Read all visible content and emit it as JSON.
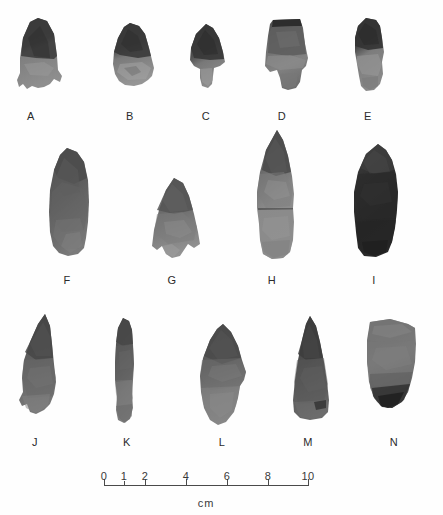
{
  "figure": {
    "type": "archaeological-artifact-plate",
    "background_color": "#fefefe",
    "ink_color": "#3a3a3a",
    "rows": 3,
    "artifact_count": 14
  },
  "artifacts": [
    {
      "label": "A",
      "row": 1,
      "form": "side-notched-point-eared-base",
      "tone": "dark-gray-over-medium-gray",
      "x": 14,
      "y": 18,
      "w": 52,
      "h": 78,
      "label_x": 21,
      "label_y": 110
    },
    {
      "label": "B",
      "row": 1,
      "form": "broad-stemmed-point",
      "tone": "dark-gray-over-light-gray",
      "x": 108,
      "y": 22,
      "w": 50,
      "h": 72,
      "label_x": 120,
      "label_y": 110
    },
    {
      "label": "C",
      "row": 1,
      "form": "deeply-side-notched-point",
      "tone": "dark-gray",
      "x": 186,
      "y": 24,
      "w": 44,
      "h": 70,
      "label_x": 196,
      "label_y": 110
    },
    {
      "label": "D",
      "row": 1,
      "form": "square-base-notched-point",
      "tone": "medium-gray",
      "x": 260,
      "y": 18,
      "w": 52,
      "h": 76,
      "label_x": 272,
      "label_y": 110
    },
    {
      "label": "E",
      "row": 1,
      "form": "narrow-stemmed-point",
      "tone": "dark-gray-mottled",
      "x": 348,
      "y": 18,
      "w": 44,
      "h": 78,
      "label_x": 358,
      "label_y": 110
    },
    {
      "label": "F",
      "row": 2,
      "form": "large-ovate-biface",
      "tone": "dark-gray",
      "x": 44,
      "y": 148,
      "w": 50,
      "h": 112,
      "label_x": 57,
      "label_y": 274
    },
    {
      "label": "G",
      "row": 2,
      "form": "stemmed-triangular-point",
      "tone": "medium-gray",
      "x": 148,
      "y": 178,
      "w": 54,
      "h": 86,
      "label_x": 162,
      "label_y": 274
    },
    {
      "label": "H",
      "row": 2,
      "form": "long-stemmed-lanceolate-point",
      "tone": "medium-gray-light-base",
      "x": 250,
      "y": 130,
      "w": 50,
      "h": 132,
      "label_x": 262,
      "label_y": 274
    },
    {
      "label": "I",
      "row": 2,
      "form": "thick-dark-biface-core",
      "tone": "near-black",
      "x": 344,
      "y": 144,
      "w": 58,
      "h": 118,
      "label_x": 364,
      "label_y": 274
    },
    {
      "label": "J",
      "row": 3,
      "form": "elongated-triangular-point",
      "tone": "dark-gray",
      "x": 14,
      "y": 314,
      "w": 48,
      "h": 110,
      "label_x": 25,
      "label_y": 436
    },
    {
      "label": "K",
      "row": 3,
      "form": "narrow-elongate-drill-point",
      "tone": "medium-dark-gray",
      "x": 110,
      "y": 318,
      "w": 28,
      "h": 108,
      "label_x": 117,
      "label_y": 436
    },
    {
      "label": "L",
      "row": 3,
      "form": "bipointed-ovate-biface",
      "tone": "medium-gray",
      "x": 194,
      "y": 324,
      "w": 56,
      "h": 104,
      "label_x": 212,
      "label_y": 436
    },
    {
      "label": "M",
      "row": 3,
      "form": "triangular-point",
      "tone": "dark-gray",
      "x": 286,
      "y": 316,
      "w": 48,
      "h": 110,
      "label_x": 298,
      "label_y": 436
    },
    {
      "label": "N",
      "row": 3,
      "form": "wedge-shaped-end-scraper",
      "tone": "medium-gray-dark-base",
      "x": 360,
      "y": 318,
      "w": 60,
      "h": 102,
      "label_x": 384,
      "label_y": 436
    }
  ],
  "scale": {
    "unit_label": "cm",
    "min": 0,
    "max": 10,
    "pixel_length": 205,
    "labeled_ticks": [
      {
        "value": "0",
        "pos_px": 0
      },
      {
        "value": "1",
        "pos_px": 20.5
      },
      {
        "value": "2",
        "pos_px": 41
      },
      {
        "value": "4",
        "pos_px": 82
      },
      {
        "value": "6",
        "pos_px": 123
      },
      {
        "value": "8",
        "pos_px": 164
      },
      {
        "value": "10",
        "pos_px": 205
      }
    ],
    "minor_ticks": [
      {
        "value": "1",
        "pos_px": 20.5
      }
    ]
  }
}
